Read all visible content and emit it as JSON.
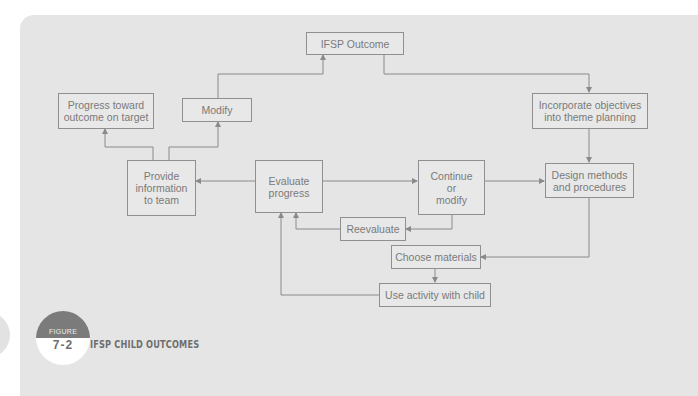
{
  "figure": {
    "label_word": "FIGURE",
    "number": "7-2",
    "title": "IFSP CHILD OUTCOMES"
  },
  "nodes": {
    "ifsp_outcome": "IFSP Outcome",
    "progress_on_target": "Progress toward\noutcome on target",
    "modify": "Modify",
    "provide_information": "Provide\ninformation\nto team",
    "evaluate_progress": "Evaluate\nprogress",
    "continue_or_modify": "Continue\nor\nmodify",
    "incorporate_objectives": "Incorporate objectives\ninto theme planning",
    "design_methods": "Design methods\nand procedures",
    "reevaluate": "Reevaluate",
    "choose_materials": "Choose materials",
    "use_activity": "Use activity with child"
  },
  "edges": [
    {
      "from": "ifsp_outcome",
      "to": "incorporate_objectives"
    },
    {
      "from": "incorporate_objectives",
      "to": "design_methods"
    },
    {
      "from": "design_methods",
      "to": "choose_materials"
    },
    {
      "from": "choose_materials",
      "to": "use_activity"
    },
    {
      "from": "use_activity",
      "to": "evaluate_progress"
    },
    {
      "from": "evaluate_progress",
      "to": "continue_or_modify"
    },
    {
      "from": "continue_or_modify",
      "to": "design_methods"
    },
    {
      "from": "continue_or_modify",
      "to": "reevaluate"
    },
    {
      "from": "reevaluate",
      "to": "evaluate_progress"
    },
    {
      "from": "evaluate_progress",
      "to": "provide_information"
    },
    {
      "from": "provide_information",
      "to": "progress_on_target"
    },
    {
      "from": "provide_information",
      "to": "modify"
    },
    {
      "from": "modify",
      "to": "ifsp_outcome"
    }
  ],
  "colors": {
    "panel": "#e5e5e5",
    "line": "#8a8a8a",
    "text": "#7a7a7a",
    "badge_dark": "#7b7b7b"
  }
}
